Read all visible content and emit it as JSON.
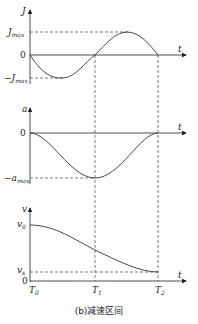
{
  "figure": {
    "caption": "(b)减速区间",
    "time_labels": {
      "t": "t",
      "T0": "T",
      "T0_sub": "0",
      "T1": "T",
      "T1_sub": "1",
      "T2": "T",
      "T2_sub": "2"
    },
    "jerk_plot": {
      "axis": "J",
      "max": "J",
      "max_sub": "max",
      "zero": "0",
      "min": "−J",
      "min_sub": "max"
    },
    "accel_plot": {
      "axis": "a",
      "zero": "0",
      "min": "−a",
      "min_sub": "max"
    },
    "velocity_plot": {
      "axis": "v",
      "v0": "v",
      "v0_sub": "0",
      "vs": "v",
      "vs_sub": "s",
      "zero": "0"
    }
  }
}
